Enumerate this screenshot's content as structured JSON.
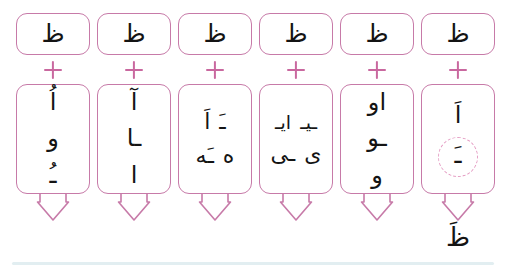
{
  "worksheet": {
    "script_direction": "rtl",
    "base_letter": "ظ",
    "operator": "+",
    "arrow_icon": "down-arrow",
    "colors": {
      "box_border": "#c77aa8",
      "operator": "#c9689f",
      "arrow": "#c77aa8",
      "glyph": "#141414",
      "highlight_circle": "#e59ec4",
      "rule_line": "#e2eef1",
      "background": "#ffffff"
    },
    "columns": [
      {
        "id": "column-1",
        "top_letter": "ظ",
        "operator": "+",
        "forms": [
          {
            "row": [
              "اُ"
            ]
          },
          {
            "row": [
              "و"
            ]
          },
          {
            "row": [
              "ـُ"
            ]
          }
        ],
        "highlighted": false,
        "result": ""
      },
      {
        "id": "column-2",
        "top_letter": "ظ",
        "operator": "+",
        "forms": [
          {
            "row": [
              "آ"
            ]
          },
          {
            "row": [
              "ـا"
            ]
          },
          {
            "row": [
              "ا"
            ]
          }
        ],
        "highlighted": false,
        "result": ""
      },
      {
        "id": "column-3",
        "top_letter": "ظ",
        "operator": "+",
        "forms": [
          {
            "row": [
              "اَ",
              "ـَ"
            ]
          },
          {
            "row": [
              "ـَه",
              "ه"
            ]
          }
        ],
        "highlighted": false,
        "result": ""
      },
      {
        "id": "column-4",
        "top_letter": "ظ",
        "operator": "+",
        "forms": [
          {
            "row": [
              "ایـ",
              "ـیـ"
            ]
          },
          {
            "row": [
              "ـی",
              "ی"
            ]
          }
        ],
        "highlighted": false,
        "result": ""
      },
      {
        "id": "column-5",
        "top_letter": "ظ",
        "operator": "+",
        "forms": [
          {
            "row": [
              "او"
            ]
          },
          {
            "row": [
              "ـو"
            ]
          },
          {
            "row": [
              "و"
            ]
          }
        ],
        "highlighted": false,
        "result": ""
      },
      {
        "id": "column-6",
        "top_letter": "ظ",
        "operator": "+",
        "forms": [
          {
            "row": [
              "اَ"
            ]
          }
        ],
        "highlighted": true,
        "highlight_form": "ـَ",
        "result": "ظَ"
      }
    ]
  }
}
